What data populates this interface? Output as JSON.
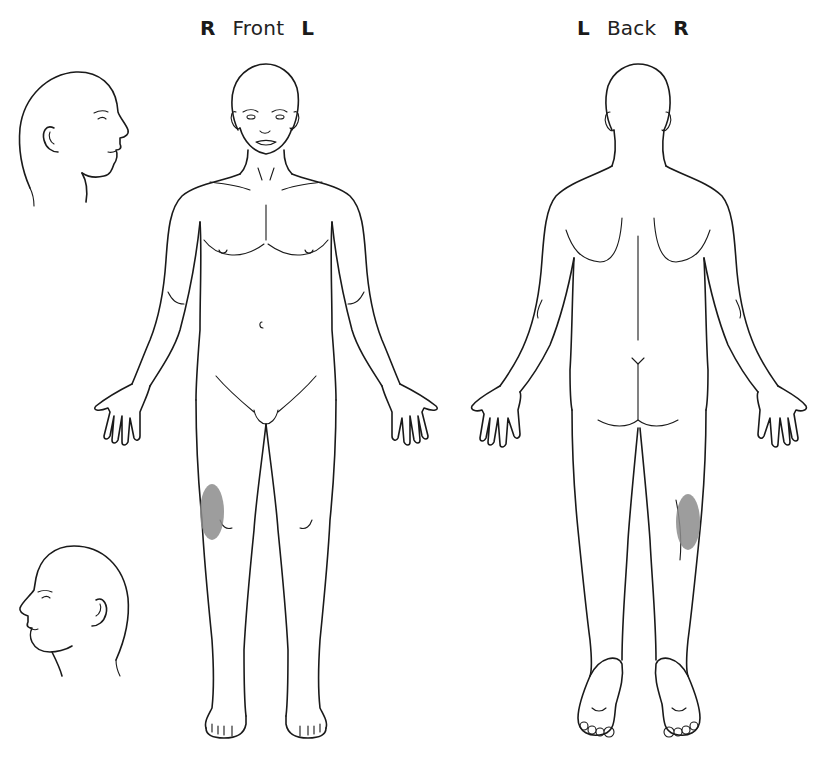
{
  "front": {
    "left_side": "R",
    "view_name": "Front",
    "right_side": "L"
  },
  "back": {
    "left_side": "L",
    "view_name": "Back",
    "right_side": "R"
  },
  "figures": [
    {
      "name": "head-profile-right",
      "description": "Head profile facing right"
    },
    {
      "name": "head-profile-left",
      "description": "Head profile facing left"
    },
    {
      "name": "body-front",
      "description": "Full body, anterior view"
    },
    {
      "name": "body-back",
      "description": "Full body, posterior view"
    }
  ],
  "annotations": [
    {
      "view": "Front",
      "region": "right knee (medial)",
      "shape": "shaded oval",
      "color": "#8c8c8c"
    },
    {
      "view": "Back",
      "region": "right knee (posterior/lateral)",
      "shape": "shaded oval",
      "color": "#8c8c8c"
    }
  ],
  "colors": {
    "line": "#1a1a1a",
    "shading": "#8c8c8c",
    "background": "#ffffff"
  }
}
